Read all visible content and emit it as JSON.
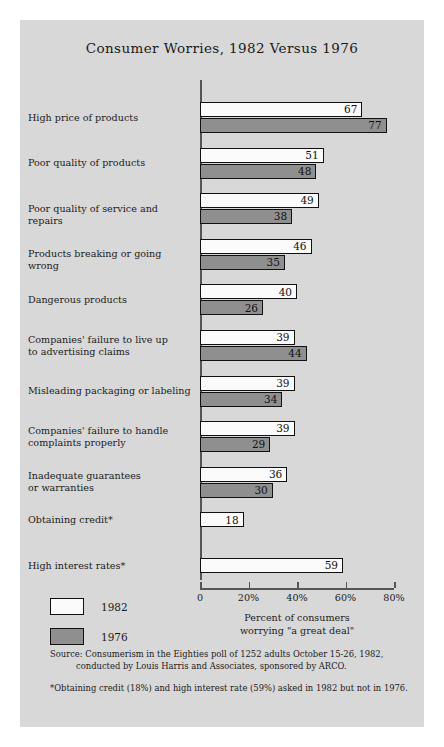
{
  "chart_data": {
    "type": "bar",
    "title": "Consumer Worries, 1982 Versus 1976",
    "orientation": "horizontal",
    "grouped": true,
    "xlabel": "Percent of consumers worrying \"a great deal\"",
    "xlabel_line1": "Percent of consumers",
    "xlabel_line2": "worrying \"a great deal\"",
    "ylabel": "",
    "xlim": [
      0,
      80
    ],
    "xticks": [
      0,
      20,
      40,
      60,
      80
    ],
    "xticklabels": [
      "0",
      "20%",
      "40%",
      "60%",
      "80%"
    ],
    "grid": false,
    "legend_position": "bottom-left",
    "categories": [
      "High price of products",
      "Poor quality of products",
      "Poor quality of service and repairs",
      "Products breaking or going wrong",
      "Dangerous products",
      "Companies' failure to live up to advertising claims",
      "Misleading packaging or labeling",
      "Companies' failure to handle complaints properly",
      "Inadequate guarantees or warranties",
      "Obtaining credit*",
      "High interest rates*"
    ],
    "category_lines": [
      [
        "High price of products"
      ],
      [
        "Poor quality of products"
      ],
      [
        "Poor quality of service and repairs"
      ],
      [
        "Products breaking or going wrong"
      ],
      [
        "Dangerous products"
      ],
      [
        "Companies' failure to live up",
        "to advertising claims"
      ],
      [
        "Misleading packaging or labeling"
      ],
      [
        "Companies' failure to handle",
        "complaints properly"
      ],
      [
        "Inadequate guarantees",
        "or warranties"
      ],
      [
        "Obtaining credit*"
      ],
      [
        "High interest rates*"
      ]
    ],
    "series": [
      {
        "name": "1982",
        "color": "#fbfbfb",
        "values": [
          67,
          51,
          49,
          46,
          40,
          39,
          39,
          39,
          36,
          18,
          59
        ]
      },
      {
        "name": "1976",
        "color": "#8f8f8f",
        "values": [
          77,
          48,
          38,
          35,
          26,
          44,
          34,
          29,
          30,
          null,
          null
        ]
      }
    ]
  },
  "legend": {
    "items": [
      {
        "label": "1982",
        "color": "#fbfbfb"
      },
      {
        "label": "1976",
        "color": "#8f8f8f"
      }
    ]
  },
  "notes": {
    "source_line1": "Source: Consumerism in the Eighties poll of 1252 adults October 15-26, 1982,",
    "source_line2": "conducted by Louis Harris and Associates, sponsored by ARCO.",
    "footnote": "*Obtaining credit (18%) and high interest rate (59%) asked in 1982 but not in 1976."
  },
  "colors": {
    "panel_background": "#d8d8d8",
    "page_background": "#ffffff",
    "bar_1982": "#fbfbfb",
    "bar_1976": "#8f8f8f",
    "bar_outline": "#111111",
    "axis": "#555555",
    "text": "#1b1b1b"
  }
}
